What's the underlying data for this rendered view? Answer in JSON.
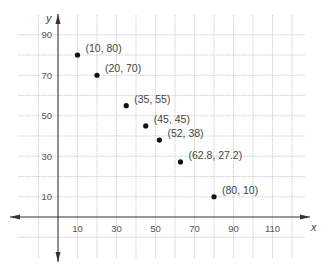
{
  "chart_data": {
    "type": "scatter",
    "title": "",
    "xlabel": "x",
    "ylabel": "y",
    "xlim": [
      -20,
      125
    ],
    "ylim": [
      -20,
      100
    ],
    "grid": true,
    "grid_step": 10,
    "x_ticks": [
      10,
      30,
      50,
      70,
      90,
      110
    ],
    "y_ticks": [
      10,
      30,
      50,
      70,
      90
    ],
    "series": [
      {
        "name": "points",
        "points": [
          {
            "x": 10,
            "y": 80,
            "label": "(10, 80)"
          },
          {
            "x": 20,
            "y": 70,
            "label": "(20, 70)"
          },
          {
            "x": 35,
            "y": 55,
            "label": "(35, 55)"
          },
          {
            "x": 45,
            "y": 45,
            "label": "(45, 45)"
          },
          {
            "x": 52,
            "y": 38,
            "label": "(52, 38)"
          },
          {
            "x": 62.8,
            "y": 27.2,
            "label": "(62.8, 27.2)"
          },
          {
            "x": 80,
            "y": 10,
            "label": "(80, 10)"
          }
        ]
      }
    ],
    "colors": {
      "grid": "#c8c8c8",
      "axis": "#333333",
      "point": "#111111"
    }
  }
}
